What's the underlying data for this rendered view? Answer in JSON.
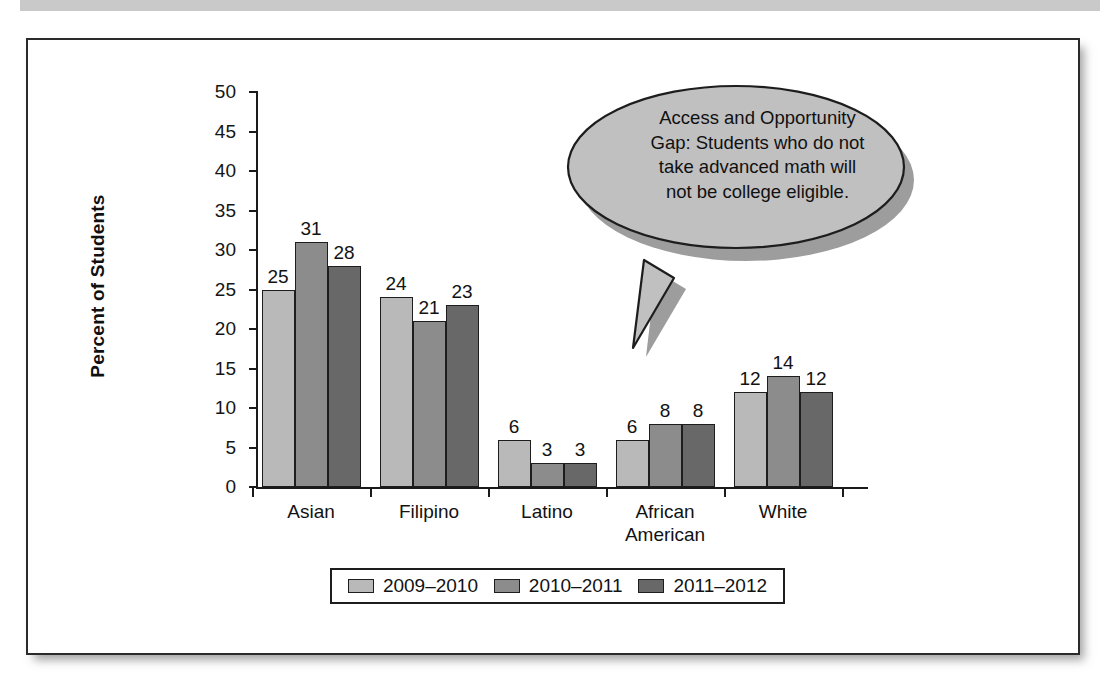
{
  "chart_data": {
    "type": "bar",
    "title": "",
    "xlabel": "",
    "ylabel": "Percent of Students",
    "ylim": [
      0,
      50
    ],
    "yticks": [
      0,
      5,
      10,
      15,
      20,
      25,
      30,
      35,
      40,
      45,
      50
    ],
    "grid": false,
    "legend_position": "bottom",
    "categories": [
      "Asian",
      "Filipino",
      "Latino",
      "African American",
      "White"
    ],
    "category_lines": [
      [
        "Asian"
      ],
      [
        "Filipino"
      ],
      [
        "Latino"
      ],
      [
        "African",
        "American"
      ],
      [
        "White"
      ]
    ],
    "series": [
      {
        "name": "2009–2010",
        "color": "#b9b9b9",
        "values": [
          25,
          24,
          6,
          6,
          12
        ]
      },
      {
        "name": "2010–2011",
        "color": "#8c8c8c",
        "values": [
          31,
          21,
          3,
          8,
          14
        ]
      },
      {
        "name": "2011–2012",
        "color": "#686868",
        "values": [
          28,
          23,
          3,
          8,
          12
        ]
      }
    ],
    "annotations": [
      {
        "name": "access-and-opportunity-gap-callout",
        "lines": [
          "Access and Opportunity",
          "Gap: Students who do not",
          "take advanced math will",
          "not be college eligible."
        ],
        "text": "Access and Opportunity Gap: Students who do not take advanced math will not be college eligible.",
        "fill": "#c0c0c0",
        "points_to": "Latino / 2011–2012 region"
      }
    ]
  },
  "axis": {
    "y_title": "Percent of Students"
  }
}
